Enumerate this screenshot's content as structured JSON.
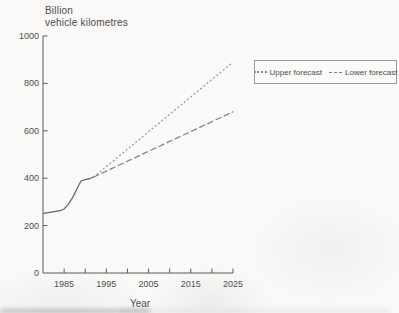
{
  "title": {
    "line1": "Billion",
    "line2": "vehicle kilometres"
  },
  "x_axis_title": "Year",
  "legend": {
    "items": [
      {
        "label": "Upper forecast",
        "style": "dotted"
      },
      {
        "label": "Lower forecast",
        "style": "dashed"
      }
    ]
  },
  "colors": {
    "actual_line": "#646464",
    "upper_forecast_line": "#949494",
    "lower_forecast_line": "#7e7e7e",
    "axis": "#5a5a5a",
    "text": "#4c4c4c",
    "background": "#faf9f7"
  },
  "chart_data": {
    "type": "line",
    "title": "Billion vehicle kilometres",
    "xlabel": "Year",
    "ylabel": "Billion vehicle kilometres",
    "xlim": [
      1980,
      2025
    ],
    "ylim": [
      0,
      1000
    ],
    "y_ticks": [
      0,
      200,
      400,
      600,
      800,
      1000
    ],
    "x_major_ticks": [
      1985,
      1995,
      2005,
      2015,
      2025
    ],
    "x_minor_ticks": [
      1985,
      1990,
      1995,
      2000,
      2005,
      2010,
      2015,
      2020,
      2025
    ],
    "grid": false,
    "legend_position": "upper right",
    "series": [
      {
        "name": "Actual traffic",
        "line_style": "solid",
        "points": [
          [
            1980,
            252
          ],
          [
            1982,
            257
          ],
          [
            1984,
            263
          ],
          [
            1985,
            270
          ],
          [
            1986,
            290
          ],
          [
            1987,
            318
          ],
          [
            1988,
            355
          ],
          [
            1989,
            388
          ],
          [
            1990,
            394
          ],
          [
            1991,
            398
          ],
          [
            1992,
            405
          ]
        ]
      },
      {
        "name": "Upper forecast",
        "line_style": "dotted",
        "points": [
          [
            1992,
            405
          ],
          [
            2025,
            890
          ]
        ]
      },
      {
        "name": "Lower forecast",
        "line_style": "dashed",
        "points": [
          [
            1992,
            405
          ],
          [
            2025,
            680
          ]
        ]
      }
    ]
  }
}
